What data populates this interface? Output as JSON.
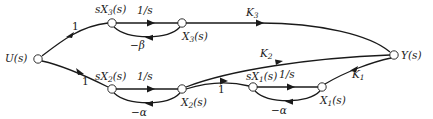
{
  "diagram": {
    "type": "signal-flow-graph",
    "nodes": {
      "input": {
        "label": "U(s)",
        "base": "U",
        "arg": "(s)"
      },
      "output": {
        "label": "Y(s)",
        "base": "Y",
        "arg": "(s)"
      },
      "sX3": {
        "label": "sX3(s)",
        "prefix": "s",
        "base": "X",
        "sub": "3",
        "arg": "(s)"
      },
      "X3": {
        "label": "X3(s)",
        "base": "X",
        "sub": "3",
        "arg": "(s)"
      },
      "sX2": {
        "label": "sX2(s)",
        "prefix": "s",
        "base": "X",
        "sub": "2",
        "arg": "(s)"
      },
      "X2": {
        "label": "X2(s)",
        "base": "X",
        "sub": "2",
        "arg": "(s)"
      },
      "sX1": {
        "label": "sX1(s)",
        "prefix": "s",
        "base": "X",
        "sub": "1",
        "arg": "(s)"
      },
      "X1": {
        "label": "X1(s)",
        "base": "X",
        "sub": "1",
        "arg": "(s)"
      }
    },
    "edges": {
      "u_to_sx3": {
        "from": "U(s)",
        "to": "sX3(s)",
        "gain": "1"
      },
      "sx3_to_x3": {
        "from": "sX3(s)",
        "to": "X3(s)",
        "gain": "1/s"
      },
      "x3_to_sx3": {
        "from": "X3(s)",
        "to": "sX3(s)",
        "gain": "−β"
      },
      "x3_to_y": {
        "from": "X3(s)",
        "to": "Y(s)",
        "gain": "K",
        "gain_sub": "3"
      },
      "u_to_sx2": {
        "from": "U(s)",
        "to": "sX2(s)",
        "gain": "1"
      },
      "sx2_to_x2": {
        "from": "sX2(s)",
        "to": "X2(s)",
        "gain": "1/s"
      },
      "x2_to_sx2": {
        "from": "X2(s)",
        "to": "sX2(s)",
        "gain": "−α"
      },
      "x2_to_y": {
        "from": "X2(s)",
        "to": "Y(s)",
        "gain": "K",
        "gain_sub": "2"
      },
      "x2_to_sx1": {
        "from": "X2(s)",
        "to": "sX1(s)",
        "gain": "1"
      },
      "sx1_to_x1": {
        "from": "sX1(s)",
        "to": "X1(s)",
        "gain": "1/s"
      },
      "x1_to_sx1": {
        "from": "X1(s)",
        "to": "sX1(s)",
        "gain": "−α"
      },
      "x1_to_y": {
        "from": "X1(s)",
        "to": "Y(s)",
        "gain": "K",
        "gain_sub": "1"
      }
    }
  }
}
